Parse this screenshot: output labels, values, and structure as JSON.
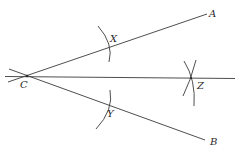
{
  "diagram": {
    "points": {
      "C": {
        "label": "C",
        "x": 27,
        "y": 76
      },
      "A": {
        "label": "A",
        "x": 207,
        "y": 14
      },
      "B": {
        "label": "B",
        "x": 205,
        "y": 140
      },
      "X": {
        "label": "X",
        "x": 108,
        "y": 48
      },
      "Y": {
        "label": "Y",
        "x": 108,
        "y": 105
      },
      "Z": {
        "label": "Z",
        "x": 191,
        "y": 78
      }
    },
    "labels": {
      "A": "A",
      "B": "B",
      "C": "C",
      "X": "X",
      "Y": "Y",
      "Z": "Z"
    },
    "segments": [
      {
        "name": "ray-CA",
        "from": "C",
        "to": "A"
      },
      {
        "name": "ray-CB",
        "from": "C",
        "to": "B"
      },
      {
        "name": "bisector-CZ",
        "from": "C",
        "to": "Z"
      }
    ],
    "arcs": [
      {
        "name": "arc-at-X",
        "center": "C"
      },
      {
        "name": "arc-at-Y",
        "center": "C"
      },
      {
        "name": "arc-from-X-at-Z",
        "center": "X"
      },
      {
        "name": "arc-from-Y-at-Z",
        "center": "Y"
      }
    ],
    "colors": {
      "stroke": "#3a3a3a",
      "label": "#2a2a2a",
      "background": "#ffffff"
    }
  }
}
